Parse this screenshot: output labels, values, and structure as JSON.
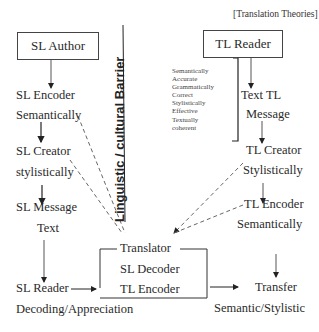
{
  "header": {
    "label": "[Translation Theories]"
  },
  "barrier": {
    "label": "Linguistic / cultural Barrier"
  },
  "source_side": {
    "author": "SL Author",
    "encoder": {
      "line1": "SL Encoder",
      "line2": "Semantically"
    },
    "creator": {
      "line1": "SL Creator",
      "line2": "stylistically"
    },
    "message": {
      "line1": "SL Message",
      "line2": "Text"
    },
    "reader": {
      "line1": "SL Reader",
      "line2": "Decoding/Appreciation"
    }
  },
  "target_side": {
    "reader": "TL Reader",
    "message": {
      "line1": "Text TL",
      "line2": "Message"
    },
    "creator": {
      "line1": "TL Creator",
      "line2": "Stylistically"
    },
    "encoder": {
      "line1": "TL Encoder",
      "line2": "Semantically"
    },
    "transfer": {
      "line1": "Transfer",
      "line2": "Semantic/Stylistic"
    },
    "qualities": [
      "Semantically",
      "Accurate",
      "Grammatically",
      "Correct",
      "Stylistically",
      "Effective",
      "Textually",
      "coherent"
    ]
  },
  "translator": {
    "title": "Translator",
    "decoder": "SL Decoder",
    "encoder": "TL Encoder"
  },
  "colors": {
    "line": "#333333",
    "text": "#2a2a2a",
    "background": "#ffffff"
  }
}
